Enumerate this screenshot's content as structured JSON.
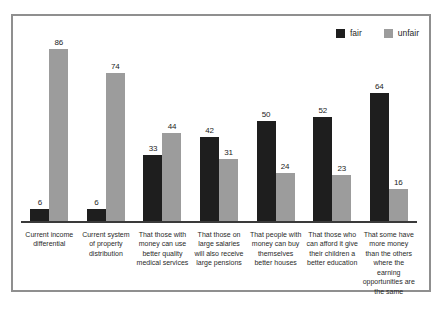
{
  "legend": {
    "items": [
      {
        "label": "fair",
        "color": "#1e1e1e"
      },
      {
        "label": "unfair",
        "color": "#9c9c9c"
      }
    ]
  },
  "chart_data": {
    "type": "bar",
    "title": "",
    "xlabel": "",
    "ylabel": "",
    "categories": [
      "Current income differential",
      "Current system of property distribution",
      "That those with money can use better quality medical services",
      "That those on large salaries will also receive large pensions",
      "That people with money can buy themselves better houses",
      "That those who can afford it give their children a better education",
      "That some have more money than the others where the earning opportunities are the same"
    ],
    "series": [
      {
        "name": "fair",
        "color": "#1e1e1e",
        "values": [
          6,
          6,
          33,
          42,
          50,
          52,
          64
        ]
      },
      {
        "name": "unfair",
        "color": "#9c9c9c",
        "values": [
          86,
          74,
          44,
          31,
          24,
          23,
          16
        ]
      }
    ],
    "ylim": [
      0,
      90
    ],
    "grid": false,
    "legend_position": "top-right",
    "value_labels": true
  },
  "colors": {
    "frame_border": "#8f8f8f",
    "axis": "#3a3a3a",
    "text": "#2a2a2a",
    "background": "#ffffff"
  }
}
